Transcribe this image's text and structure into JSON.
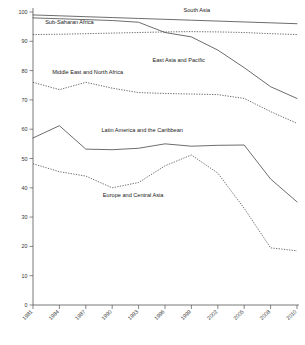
{
  "chart_data": {
    "type": "line",
    "title": "",
    "subtitle": "",
    "xlabel": "",
    "ylabel": "",
    "xlim": [
      1981,
      2010
    ],
    "ylim": [
      0,
      100
    ],
    "grid": false,
    "legend_position": "inline-labels",
    "x": [
      1981,
      1984,
      1987,
      1990,
      1993,
      1996,
      1999,
      2002,
      2005,
      2008,
      2010
    ],
    "xticklabels": [
      "1981",
      "1984",
      "1987",
      "1990",
      "1993",
      "1996",
      "1999",
      "2002",
      "2005",
      "2008",
      "2010"
    ],
    "yticklabels": [
      "0",
      "10",
      "20",
      "30",
      "40",
      "50",
      "60",
      "70",
      "80",
      "90",
      "100"
    ],
    "yticks": [
      0,
      10,
      20,
      30,
      40,
      50,
      60,
      70,
      80,
      90,
      100
    ],
    "series": [
      {
        "name": "South Asia",
        "style": "solid",
        "label_x": 1999,
        "label_y": 100,
        "values": [
          99.0,
          98.7,
          98.4,
          98.1,
          97.8,
          97.5,
          97.2,
          96.9,
          96.6,
          96.3,
          96.0
        ]
      },
      {
        "name": "Sub-Saharan Africa",
        "style": "dotted",
        "label_x": 1985,
        "label_y": 96,
        "values": [
          92.3,
          92.4,
          92.6,
          92.8,
          93.0,
          93.2,
          93.3,
          93.2,
          93.0,
          92.6,
          92.3
        ]
      },
      {
        "name": "East Asia and Pacific",
        "style": "solid",
        "label_x": 1997,
        "label_y": 83,
        "values": [
          98.0,
          97.7,
          97.4,
          97.1,
          96.5,
          93.0,
          91.5,
          87.0,
          81.0,
          74.5,
          70.5
        ]
      },
      {
        "name": "Middle East and North Africa",
        "style": "dotted",
        "label_x": 1987,
        "label_y": 79,
        "values": [
          76.0,
          73.5,
          76.0,
          74.0,
          72.5,
          72.2,
          72.0,
          71.8,
          70.5,
          66.0,
          62.0
        ]
      },
      {
        "name": "Latin America and the Caribbean",
        "style": "solid",
        "label_x": 1993,
        "label_y": 59,
        "values": [
          57.0,
          61.2,
          53.2,
          53.0,
          53.5,
          55.0,
          54.2,
          54.5,
          54.6,
          43.0,
          35.2
        ]
      },
      {
        "name": "Europe and Central Asia",
        "style": "dotted",
        "label_x": 1992,
        "label_y": 37,
        "values": [
          48.2,
          45.5,
          44.0,
          40.0,
          41.8,
          47.5,
          51.2,
          45.0,
          33.0,
          19.5,
          18.5
        ]
      }
    ]
  }
}
